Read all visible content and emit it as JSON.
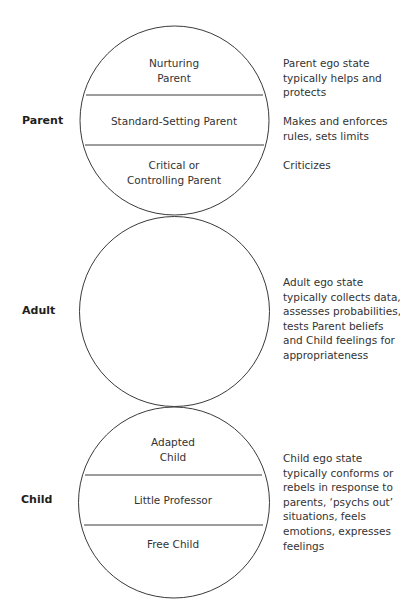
{
  "diagram": {
    "type": "ego-state-model",
    "line_color": "#3a3a3a",
    "states": [
      {
        "label": "Parent",
        "subdivisions": [
          {
            "line1": "Nurturing",
            "line2": "Parent"
          },
          {
            "line1": "Standard-Setting Parent",
            "line2": ""
          },
          {
            "line1": "Critical or",
            "line2": "Controlling Parent"
          }
        ],
        "descriptions": [
          {
            "lines": [
              "Parent ego state",
              "typically helps and",
              "protects"
            ]
          },
          {
            "lines": [
              "Makes and enforces",
              "rules, sets limits"
            ]
          },
          {
            "lines": [
              "Criticizes"
            ]
          }
        ]
      },
      {
        "label": "Adult",
        "subdivisions": [],
        "descriptions": [
          {
            "lines": [
              "Adult ego state",
              "typically collects data,",
              "assesses probabilities,",
              "tests Parent beliefs",
              "and Child feelings for",
              "appropriateness"
            ]
          }
        ]
      },
      {
        "label": "Child",
        "subdivisions": [
          {
            "line1": "Adapted",
            "line2": "Child"
          },
          {
            "line1": "Little Professor",
            "line2": ""
          },
          {
            "line1": "Free Child",
            "line2": ""
          }
        ],
        "descriptions": [
          {
            "lines": [
              "Child ego state",
              "typically conforms or",
              "rebels in response to",
              "parents, ‘psychs out’",
              "situations, feels",
              "emotions, expresses",
              "feelings"
            ]
          }
        ]
      }
    ]
  }
}
